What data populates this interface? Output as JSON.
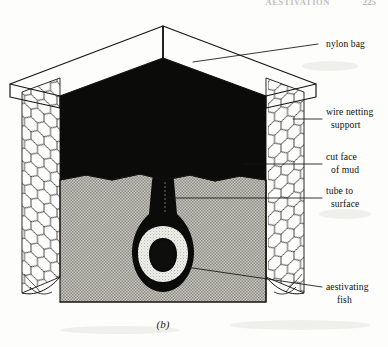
{
  "header": {
    "running_title": "AESTIVATION",
    "page_number": "225"
  },
  "figure": {
    "caption": "(b)",
    "labels": [
      {
        "id": "nylon-bag",
        "text_line1": "nylon bag",
        "text_line2": ""
      },
      {
        "id": "wire-netting",
        "text_line1": "wire netting",
        "text_line2": "support"
      },
      {
        "id": "cut-face-of-mud",
        "text_line1": "cut face",
        "text_line2": "of mud"
      },
      {
        "id": "tube-to-surface",
        "text_line1": "tube to",
        "text_line2": "surface"
      },
      {
        "id": "aestivating-fish",
        "text_line1": "aestivating",
        "text_line2": "fish"
      }
    ],
    "regions": [
      {
        "id": "nylon-bag-interior",
        "name": "nylon bag interior",
        "color": "#0b0b0a"
      },
      {
        "id": "mud-block",
        "name": "cut face of mud",
        "color": "#b9b9b2"
      },
      {
        "id": "fish-cocoon",
        "name": "aestivating fish cocoon",
        "color": "#0b0b0a"
      },
      {
        "id": "fish-body",
        "name": "coiled fish body",
        "color": "#f4f4ef"
      }
    ]
  },
  "colors": {
    "ink": "#16130f",
    "black_fill": "#0b0b0a",
    "mud_gray": "#b9b9b2",
    "paper": "#fdfdfb",
    "fish_white": "#f4f4ef"
  }
}
